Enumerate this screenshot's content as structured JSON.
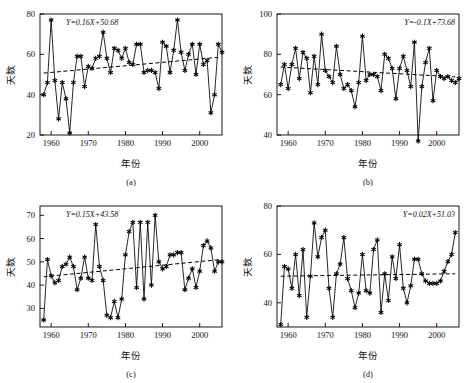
{
  "figure": {
    "panels_count": 4,
    "marker": "asterisk",
    "line_color": "#000000",
    "trend_color": "#000000",
    "background": "#ffffff"
  },
  "chart_data": [
    {
      "type": "line",
      "panel_label": "(a)",
      "title": "",
      "annotation": "Y=0.16X+50.68",
      "xlabel": "年份",
      "ylabel": "天数",
      "xlim": [
        1957,
        2006
      ],
      "ylim": [
        20,
        80
      ],
      "xticks": [
        1960,
        1970,
        1980,
        1990,
        2000
      ],
      "yticks": [
        20,
        40,
        60,
        80
      ],
      "grid": false,
      "legend": "none",
      "trend": {
        "slope": 0.16,
        "intercept": 50.68,
        "style": "dashed",
        "y_start": 50.7,
        "y_end": 58.5
      },
      "x": [
        1958,
        1959,
        1960,
        1961,
        1962,
        1963,
        1964,
        1965,
        1966,
        1967,
        1968,
        1969,
        1970,
        1971,
        1972,
        1973,
        1974,
        1975,
        1976,
        1977,
        1978,
        1979,
        1980,
        1981,
        1982,
        1983,
        1984,
        1985,
        1986,
        1987,
        1988,
        1989,
        1990,
        1991,
        1992,
        1993,
        1994,
        1995,
        1996,
        1997,
        1998,
        1999,
        2000,
        2001,
        2002,
        2003,
        2004,
        2005,
        2006
      ],
      "values": [
        40,
        46,
        77,
        47,
        28,
        46,
        38,
        21,
        46,
        59,
        59,
        44,
        54,
        53,
        58,
        59,
        71,
        58,
        51,
        63,
        62,
        58,
        63,
        56,
        55,
        65,
        65,
        51,
        52,
        52,
        51,
        43,
        66,
        64,
        51,
        62,
        77,
        61,
        52,
        60,
        65,
        50,
        65,
        55,
        57,
        31,
        40,
        65,
        61
      ]
    },
    {
      "type": "line",
      "panel_label": "(b)",
      "title": "",
      "annotation": "Y=-0.1X+73.68",
      "xlabel": "年份",
      "ylabel": "天数",
      "xlim": [
        1957,
        2006
      ],
      "ylim": [
        40,
        100
      ],
      "xticks": [
        1960,
        1970,
        1980,
        1990,
        2000
      ],
      "yticks": [
        40,
        60,
        80,
        100
      ],
      "grid": false,
      "legend": "none",
      "trend": {
        "slope": -0.1,
        "intercept": 73.68,
        "style": "dashed",
        "y_start": 73.7,
        "y_end": 68.8
      },
      "x": [
        1958,
        1959,
        1960,
        1961,
        1962,
        1963,
        1964,
        1965,
        1966,
        1967,
        1968,
        1969,
        1970,
        1971,
        1972,
        1973,
        1974,
        1975,
        1976,
        1977,
        1978,
        1979,
        1980,
        1981,
        1982,
        1983,
        1984,
        1985,
        1986,
        1987,
        1988,
        1989,
        1990,
        1991,
        1992,
        1993,
        1994,
        1995,
        1996,
        1997,
        1998,
        1999,
        2000,
        2001,
        2002,
        2003,
        2004,
        2005,
        2006
      ],
      "values": [
        65,
        75,
        63,
        75,
        83,
        68,
        81,
        78,
        61,
        79,
        65,
        90,
        72,
        69,
        66,
        84,
        70,
        63,
        65,
        62,
        54,
        66,
        89,
        67,
        70,
        70,
        69,
        62,
        80,
        78,
        73,
        58,
        73,
        79,
        72,
        64,
        86,
        37,
        64,
        76,
        83,
        57,
        72,
        69,
        68,
        69,
        67,
        66,
        68
      ]
    },
    {
      "type": "line",
      "panel_label": "(c)",
      "title": "",
      "annotation": "Y=0.15X+43.58",
      "xlabel": "年份",
      "ylabel": "天数",
      "xlim": [
        1957,
        2006
      ],
      "ylim": [
        22,
        74
      ],
      "xticks": [
        1960,
        1970,
        1980,
        1990,
        2000
      ],
      "yticks": [
        30,
        40,
        50,
        60,
        70
      ],
      "grid": false,
      "legend": "none",
      "trend": {
        "slope": 0.15,
        "intercept": 43.58,
        "style": "dashed",
        "y_start": 43.6,
        "y_end": 50.9
      },
      "x": [
        1958,
        1959,
        1960,
        1961,
        1962,
        1963,
        1964,
        1965,
        1966,
        1967,
        1968,
        1969,
        1970,
        1971,
        1972,
        1973,
        1974,
        1975,
        1976,
        1977,
        1978,
        1979,
        1980,
        1981,
        1982,
        1983,
        1984,
        1985,
        1986,
        1987,
        1988,
        1989,
        1990,
        1991,
        1992,
        1993,
        1994,
        1995,
        1996,
        1997,
        1998,
        1999,
        2000,
        2001,
        2002,
        2003,
        2004,
        2005,
        2006
      ],
      "values": [
        25,
        51,
        44,
        41,
        42,
        48,
        49,
        52,
        48,
        38,
        43,
        52,
        43,
        42,
        66,
        48,
        42,
        27,
        26,
        33,
        26,
        34,
        53,
        63,
        67,
        39,
        67,
        34,
        67,
        40,
        70,
        50,
        47,
        48,
        53,
        53,
        54,
        54,
        38,
        43,
        47,
        39,
        46,
        57,
        59,
        56,
        46,
        50,
        50
      ]
    },
    {
      "type": "line",
      "panel_label": "(d)",
      "title": "",
      "annotation": "Y=0.02X+51.03",
      "xlabel": "年份",
      "ylabel": "天数",
      "xlim": [
        1957,
        2006
      ],
      "ylim": [
        30,
        80
      ],
      "xticks": [
        1960,
        1970,
        1980,
        1990,
        2000
      ],
      "yticks": [
        40,
        60,
        80
      ],
      "grid": false,
      "legend": "none",
      "trend": {
        "slope": 0.02,
        "intercept": 51.03,
        "style": "dashed",
        "y_start": 51.0,
        "y_end": 52.0
      },
      "x": [
        1958,
        1959,
        1960,
        1961,
        1962,
        1963,
        1964,
        1965,
        1966,
        1967,
        1968,
        1969,
        1970,
        1971,
        1972,
        1973,
        1974,
        1975,
        1976,
        1977,
        1978,
        1979,
        1980,
        1981,
        1982,
        1983,
        1984,
        1985,
        1986,
        1987,
        1988,
        1989,
        1990,
        1991,
        1992,
        1993,
        1994,
        1995,
        1996,
        1997,
        1998,
        1999,
        2000,
        2001,
        2002,
        2003,
        2004,
        2005
      ],
      "values": [
        31,
        55,
        54,
        46,
        60,
        43,
        62,
        34,
        51,
        73,
        59,
        67,
        70,
        46,
        34,
        52,
        56,
        67,
        50,
        45,
        38,
        44,
        60,
        45,
        44,
        62,
        66,
        36,
        52,
        41,
        59,
        50,
        64,
        46,
        40,
        47,
        58,
        58,
        52,
        49,
        48,
        48,
        48,
        49,
        53,
        57,
        60,
        69
      ]
    }
  ]
}
